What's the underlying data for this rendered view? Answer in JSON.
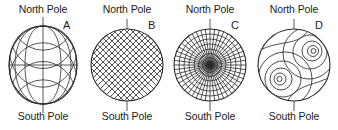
{
  "figure": {
    "background_color": "#ffffff",
    "line_color": "#2b2b2b",
    "text_color": "#1b1b1b",
    "width_px": 338,
    "height_px": 130
  },
  "panels": [
    {
      "letter": "A",
      "north_label": "North Pole",
      "south_label": "South Pole",
      "diagram": "globe-graticule",
      "description": "Sphere with meridians and parallels (globe graticule)",
      "meridian_count": 7,
      "parallel_count": 7
    },
    {
      "letter": "B",
      "north_label": "North Pole",
      "south_label": "South Pole",
      "diagram": "diagonal-crosshatch",
      "description": "Circle filled with 45 degree diagonal crosshatch grid",
      "hatch_spacing_px": 6,
      "hatch_angle_deg": 45
    },
    {
      "letter": "C",
      "north_label": "North Pole",
      "south_label": "South Pole",
      "diagram": "polar-azimuthal-grid",
      "description": "Polar grid: concentric circles with radial spokes converging at a dark center",
      "ring_count": 8,
      "spoke_count": 24
    },
    {
      "letter": "D",
      "north_label": "North Pole",
      "south_label": "South Pole",
      "diagram": "offset-contour-circles",
      "description": "Circle containing two groups of nested offset contour circles",
      "contour_groups": 2
    }
  ]
}
